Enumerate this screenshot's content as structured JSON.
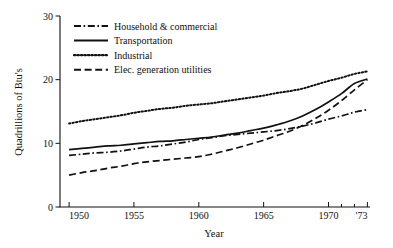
{
  "chart_data": {
    "type": "line",
    "title": "",
    "xlabel": "Year",
    "ylabel": "Quadrillions of Btu's",
    "xlim": [
      1949.3,
      1973.2
    ],
    "ylim": [
      0,
      30
    ],
    "grid": false,
    "legend_position": "top-left",
    "x_ticks": [
      {
        "value": 1950,
        "label": "1950"
      },
      {
        "value": 1955,
        "label": "1955"
      },
      {
        "value": 1960,
        "label": "1960"
      },
      {
        "value": 1965,
        "label": "1965"
      },
      {
        "value": 1970,
        "label": "1970"
      },
      {
        "value": 1973,
        "label": "'73"
      }
    ],
    "x_minor_ticks": [
      1971,
      1972
    ],
    "y_ticks": [
      {
        "value": 0,
        "label": "0"
      },
      {
        "value": 10,
        "label": "10"
      },
      {
        "value": 20,
        "label": "20"
      },
      {
        "value": 30,
        "label": "30"
      }
    ],
    "x": [
      1950,
      1951,
      1952,
      1953,
      1954,
      1955,
      1956,
      1957,
      1958,
      1959,
      1960,
      1961,
      1962,
      1963,
      1964,
      1965,
      1966,
      1967,
      1968,
      1969,
      1970,
      1971,
      1972,
      1973
    ],
    "series": [
      {
        "name": "Household & commercial",
        "style": "dash-dot",
        "values": [
          8.1,
          8.3,
          8.5,
          8.6,
          8.8,
          9.1,
          9.4,
          9.6,
          9.9,
          10.2,
          10.6,
          10.9,
          11.2,
          11.4,
          11.6,
          11.8,
          12.0,
          12.3,
          12.7,
          13.2,
          13.8,
          14.3,
          14.9,
          15.3
        ]
      },
      {
        "name": "Transportation",
        "style": "solid",
        "values": [
          9.0,
          9.2,
          9.4,
          9.6,
          9.7,
          9.9,
          10.1,
          10.3,
          10.4,
          10.6,
          10.8,
          11.0,
          11.3,
          11.6,
          12.0,
          12.4,
          12.9,
          13.5,
          14.3,
          15.3,
          16.5,
          17.8,
          19.4,
          20.1
        ]
      },
      {
        "name": "Industrial",
        "style": "dotted",
        "values": [
          13.1,
          13.5,
          13.8,
          14.1,
          14.4,
          14.8,
          15.1,
          15.4,
          15.6,
          15.9,
          16.1,
          16.3,
          16.6,
          16.9,
          17.2,
          17.5,
          17.9,
          18.2,
          18.6,
          19.2,
          19.8,
          20.3,
          20.9,
          21.3
        ]
      },
      {
        "name": "Elec. generation utilities",
        "style": "dashed",
        "values": [
          5.0,
          5.4,
          5.7,
          6.1,
          6.4,
          6.8,
          7.1,
          7.3,
          7.5,
          7.7,
          7.9,
          8.3,
          8.8,
          9.3,
          9.9,
          10.5,
          11.2,
          11.9,
          12.8,
          13.9,
          15.2,
          16.7,
          18.4,
          20.0
        ]
      }
    ]
  },
  "legend": {
    "items": [
      {
        "label": "Household & commercial",
        "style": "dash-dot"
      },
      {
        "label": "Transportation",
        "style": "solid"
      },
      {
        "label": "Industrial",
        "style": "dotted"
      },
      {
        "label": "Elec. generation utilities",
        "style": "dashed"
      }
    ]
  },
  "axes": {
    "x_title": "Year",
    "y_title": "Quadrillions of Btu's"
  }
}
